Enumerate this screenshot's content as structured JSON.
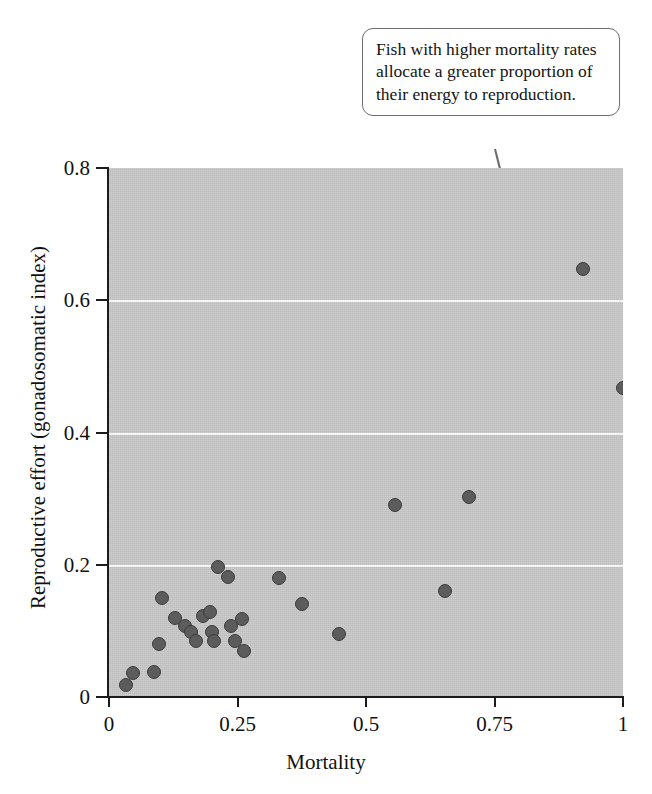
{
  "annotation": {
    "text": "Fish with higher mortality rates allocate a greater proportion of their energy to reproduction."
  },
  "chart_data": {
    "type": "scatter",
    "title": "",
    "xlabel": "Mortality",
    "ylabel": "Reproductive effort (gonadosomatic index)",
    "xlim": [
      0,
      1
    ],
    "ylim": [
      0,
      0.8
    ],
    "xticks": [
      "0",
      "0.25",
      "0.5",
      "0.75",
      "1"
    ],
    "xtick_values": [
      0,
      0.25,
      0.5,
      0.75,
      1
    ],
    "yticks": [
      "0",
      "0.2",
      "0.4",
      "0.6",
      "0.8"
    ],
    "ytick_values": [
      0,
      0.2,
      0.4,
      0.6,
      0.8
    ],
    "grid": "horizontal-white-gridlines-at-0.2-0.4-0.6",
    "legend": "none",
    "plot_background_color": "#c7c7c7",
    "marker_color": "#5c5c5c",
    "marker_edge_color": "#3b3b3b",
    "gridline_color": "#f4f4f4",
    "annotation_text": "Fish with higher mortality rates allocate a greater proportion of their energy to reproduction.",
    "points": [
      {
        "x": 0.033,
        "y": 0.018
      },
      {
        "x": 0.047,
        "y": 0.037
      },
      {
        "x": 0.088,
        "y": 0.038
      },
      {
        "x": 0.104,
        "y": 0.15
      },
      {
        "x": 0.098,
        "y": 0.08
      },
      {
        "x": 0.128,
        "y": 0.12
      },
      {
        "x": 0.148,
        "y": 0.108
      },
      {
        "x": 0.16,
        "y": 0.098
      },
      {
        "x": 0.17,
        "y": 0.085
      },
      {
        "x": 0.183,
        "y": 0.122
      },
      {
        "x": 0.196,
        "y": 0.128
      },
      {
        "x": 0.2,
        "y": 0.098
      },
      {
        "x": 0.205,
        "y": 0.085
      },
      {
        "x": 0.213,
        "y": 0.196
      },
      {
        "x": 0.232,
        "y": 0.182
      },
      {
        "x": 0.238,
        "y": 0.108
      },
      {
        "x": 0.246,
        "y": 0.084
      },
      {
        "x": 0.258,
        "y": 0.118
      },
      {
        "x": 0.262,
        "y": 0.069
      },
      {
        "x": 0.33,
        "y": 0.18
      },
      {
        "x": 0.375,
        "y": 0.14
      },
      {
        "x": 0.447,
        "y": 0.096
      },
      {
        "x": 0.557,
        "y": 0.29
      },
      {
        "x": 0.653,
        "y": 0.16
      },
      {
        "x": 0.7,
        "y": 0.303
      },
      {
        "x": 0.922,
        "y": 0.648
      },
      {
        "x": 1.0,
        "y": 0.468
      }
    ]
  }
}
